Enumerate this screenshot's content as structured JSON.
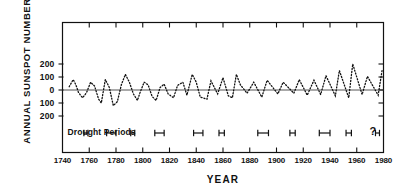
{
  "figure": {
    "ylabel": "ANNUAL SUNSPOT NUMBERS",
    "xlabel": "YEAR",
    "drought_label": "Drought  Periods",
    "uncertain_marker": "?",
    "axis_color": "#111111",
    "series_color": "#111111"
  },
  "chart_data": {
    "type": "line",
    "title": "",
    "xlabel": "YEAR",
    "ylabel": "ANNUAL SUNSPOT NUMBERS",
    "xlim": [
      1740,
      1980
    ],
    "ylim": [
      -250,
      250
    ],
    "grid": false,
    "legend": "none",
    "xticks": [
      1740,
      1760,
      1780,
      1800,
      1820,
      1840,
      1860,
      1880,
      1900,
      1920,
      1940,
      1960,
      1980
    ],
    "xtick_labels": [
      "1740",
      "1760",
      "1780",
      "1800",
      "1820",
      "1840",
      "1860",
      "1880",
      "1900",
      "1920",
      "1940",
      "1960",
      "1980"
    ],
    "yticks": [
      200,
      100,
      0,
      -100,
      -200
    ],
    "ytick_labels": [
      "200",
      "100",
      "0",
      "100",
      "200"
    ],
    "line_style": "dotted",
    "zero_line": true,
    "series": [
      {
        "name": "Annual sunspot number (alternating sign by cycle)",
        "x": [
          1745,
          1748,
          1750,
          1752,
          1755,
          1758,
          1761,
          1764,
          1767,
          1769,
          1772,
          1775,
          1778,
          1781,
          1784,
          1787,
          1790,
          1793,
          1796,
          1798,
          1801,
          1804,
          1807,
          1810,
          1813,
          1816,
          1819,
          1823,
          1826,
          1830,
          1833,
          1837,
          1840,
          1843,
          1848,
          1851,
          1856,
          1860,
          1864,
          1867,
          1870,
          1873,
          1878,
          1883,
          1889,
          1893,
          1901,
          1905,
          1913,
          1917,
          1923,
          1928,
          1933,
          1937,
          1944,
          1947,
          1954,
          1957,
          1964,
          1968,
          1976,
          1979
        ],
        "values": [
          25,
          80,
          40,
          -20,
          -60,
          -20,
          60,
          30,
          -70,
          -100,
          80,
          20,
          -120,
          -90,
          40,
          120,
          60,
          -30,
          -80,
          -20,
          60,
          40,
          -50,
          -80,
          20,
          45,
          -30,
          -60,
          35,
          60,
          -40,
          120,
          60,
          -55,
          -70,
          70,
          -30,
          95,
          -45,
          -60,
          120,
          40,
          -25,
          60,
          -55,
          75,
          -30,
          60,
          -25,
          80,
          -40,
          75,
          -35,
          110,
          -45,
          150,
          -60,
          200,
          -35,
          105,
          -40,
          155
        ],
        "peak_values": {
          "1778": 120,
          "1787": 120,
          "1870": 120,
          "1937": 110,
          "1947": 150,
          "1957": 200,
          "1979": 155
        },
        "note": "Values plotted alternate above and below the zero line marking successive solar cycles; vertical scale runs 200-100-0-100-200."
      }
    ],
    "drought_periods": [
      {
        "start": 1756,
        "end": 1759
      },
      {
        "start": 1773,
        "end": 1780
      },
      {
        "start": 1791,
        "end": 1794
      },
      {
        "start": 1809,
        "end": 1816
      },
      {
        "start": 1838,
        "end": 1845
      },
      {
        "start": 1857,
        "end": 1861
      },
      {
        "start": 1886,
        "end": 1894
      },
      {
        "start": 1910,
        "end": 1914
      },
      {
        "start": 1932,
        "end": 1940
      },
      {
        "start": 1952,
        "end": 1956
      },
      {
        "start": 1974,
        "end": 1977
      }
    ],
    "drought_label": "Drought  Periods",
    "uncertain_marker": "?"
  }
}
